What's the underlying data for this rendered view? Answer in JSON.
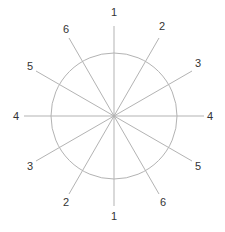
{
  "diagram": {
    "type": "circle-with-radial-lines",
    "colors": {
      "line": "#b3b3b3",
      "circle": "#b3b3b3",
      "label": "#333333",
      "background": "#ffffff"
    },
    "circle": {
      "cx": 114,
      "cy": 116,
      "r": 63
    },
    "lines": [
      {
        "id": "1",
        "x1": 114,
        "y1": 26,
        "x2": 114,
        "y2": 206,
        "label_start": "1",
        "label_end": "1",
        "lx1": 114,
        "ly1": 16,
        "lx2": 114,
        "ly2": 220
      },
      {
        "id": "2",
        "x1": 159,
        "y1": 38,
        "x2": 69,
        "y2": 194,
        "label_start": "2",
        "label_end": "2",
        "lx1": 162,
        "ly1": 30,
        "lx2": 66,
        "ly2": 206
      },
      {
        "id": "3",
        "x1": 192,
        "y1": 71,
        "x2": 36,
        "y2": 161,
        "label_start": "3",
        "label_end": "3",
        "lx1": 198,
        "ly1": 67,
        "lx2": 30,
        "ly2": 170
      },
      {
        "id": "4",
        "x1": 204,
        "y1": 116,
        "x2": 24,
        "y2": 116,
        "label_start": "4",
        "label_end": "4",
        "lx1": 210,
        "ly1": 120,
        "lx2": 16,
        "ly2": 120
      },
      {
        "id": "5",
        "x1": 36,
        "y1": 71,
        "x2": 192,
        "y2": 161,
        "label_start": "5",
        "label_end": "5",
        "lx1": 30,
        "ly1": 70,
        "lx2": 198,
        "ly2": 170
      },
      {
        "id": "6",
        "x1": 69,
        "y1": 38,
        "x2": 159,
        "y2": 194,
        "label_start": "6",
        "label_end": "6",
        "lx1": 66,
        "ly1": 33,
        "lx2": 163,
        "ly2": 206
      }
    ]
  }
}
